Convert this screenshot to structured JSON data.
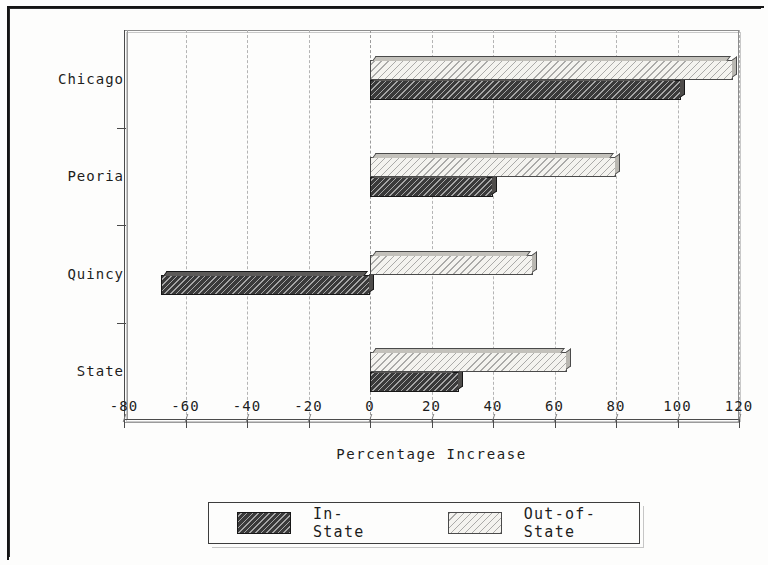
{
  "chart_data": {
    "type": "bar",
    "orientation": "horizontal",
    "title": "",
    "xlabel": "Percentage Increase",
    "ylabel": "",
    "xlim": [
      -80,
      120
    ],
    "ylim": null,
    "grid": true,
    "legend_position": "bottom",
    "categories": [
      "Chicago",
      "Peoria",
      "Quincy",
      "State"
    ],
    "xticks": [
      -80,
      -60,
      -40,
      -20,
      0,
      20,
      40,
      60,
      80,
      100,
      120
    ],
    "xticklabels": [
      "-80",
      "-60",
      "-40",
      "-20",
      "0",
      "20",
      "40",
      "60",
      "80",
      "100",
      "120"
    ],
    "series": [
      {
        "name": "In-State",
        "values": [
          101,
          40,
          -68,
          29
        ],
        "fill": "dark-hatch",
        "color": "#3a3a3a"
      },
      {
        "name": "Out-of-State",
        "values": [
          118,
          80,
          53,
          64
        ],
        "fill": "light-hatch",
        "color": "#f4f3ef"
      }
    ]
  },
  "axis": {
    "xlabel": "Percentage Increase"
  },
  "legend": {
    "items": [
      {
        "label": "In-State"
      },
      {
        "label": "Out-of-State"
      }
    ]
  }
}
